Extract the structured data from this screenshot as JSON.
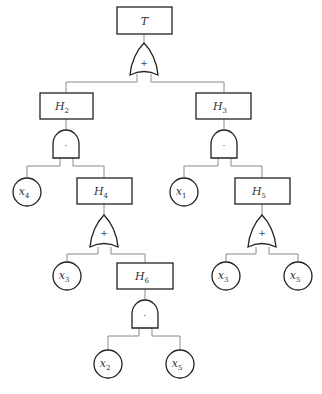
{
  "diagram": {
    "type": "fault-tree",
    "events": {
      "top": {
        "base": "T",
        "sub": ""
      },
      "h2": {
        "base": "H",
        "sub": "2"
      },
      "h3": {
        "base": "H",
        "sub": "3"
      },
      "h4": {
        "base": "H",
        "sub": "4"
      },
      "h5": {
        "base": "H",
        "sub": "5"
      },
      "h6": {
        "base": "H",
        "sub": "6"
      }
    },
    "gates": {
      "g_top": {
        "type": "OR",
        "symbol": "+"
      },
      "g_h2": {
        "type": "AND",
        "symbol": "·"
      },
      "g_h3": {
        "type": "AND",
        "symbol": "·"
      },
      "g_h4": {
        "type": "OR",
        "symbol": "+"
      },
      "g_h5": {
        "type": "OR",
        "symbol": "+"
      },
      "g_h6": {
        "type": "AND",
        "symbol": "·"
      }
    },
    "basic_events": {
      "x4_a": {
        "base": "x",
        "sub": "4"
      },
      "x1_a": {
        "base": "x",
        "sub": "1"
      },
      "x3_a": {
        "base": "x",
        "sub": "3"
      },
      "x3_b": {
        "base": "x",
        "sub": "3"
      },
      "x5_a": {
        "base": "x",
        "sub": "5"
      },
      "x2_a": {
        "base": "x",
        "sub": "2"
      },
      "x5_b": {
        "base": "x",
        "sub": "5"
      }
    },
    "structure": [
      {
        "parent": "T",
        "gate": "OR",
        "children": [
          "H2",
          "H3"
        ]
      },
      {
        "parent": "H2",
        "gate": "AND",
        "children": [
          "x4",
          "H4"
        ]
      },
      {
        "parent": "H3",
        "gate": "AND",
        "children": [
          "x1",
          "H5"
        ]
      },
      {
        "parent": "H4",
        "gate": "OR",
        "children": [
          "x3",
          "H6"
        ]
      },
      {
        "parent": "H5",
        "gate": "OR",
        "children": [
          "x3",
          "x5"
        ]
      },
      {
        "parent": "H6",
        "gate": "AND",
        "children": [
          "x2",
          "x5"
        ]
      }
    ]
  }
}
